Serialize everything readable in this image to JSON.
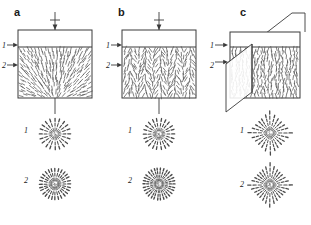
{
  "figure": {
    "background_color": "#ffffff",
    "line_color": "#3a3a3a",
    "director_color": "#555555"
  },
  "panels": [
    {
      "letter": "a",
      "layer_labels": [
        "1",
        "2"
      ],
      "top_symbol": "downward-arrow",
      "bottom_symbol": "vertical-line",
      "cell": {
        "isotropic_layer_label": "1",
        "nematic_layer_label": "2",
        "director_pattern": "radial-splay-from-bottom-center"
      },
      "patterns": [
        {
          "label": "1",
          "type": "radial-star",
          "rays": 20,
          "dashes_per_ray": 3,
          "shape": "circular"
        },
        {
          "label": "2",
          "type": "radial-star",
          "rays": 28,
          "dashes_per_ray": 3,
          "shape": "circular"
        }
      ]
    },
    {
      "letter": "b",
      "layer_labels": [
        "1",
        "2"
      ],
      "top_symbol": "downward-arrow",
      "bottom_symbol": "vertical-line",
      "cell": {
        "isotropic_layer_label": "1",
        "nematic_layer_label": "2",
        "director_pattern": "vertical-wavy-columns"
      },
      "patterns": [
        {
          "label": "1",
          "type": "radial-star",
          "rays": 22,
          "dashes_per_ray": 3,
          "shape": "circular"
        },
        {
          "label": "2",
          "type": "radial-star",
          "rays": 30,
          "dashes_per_ray": 4,
          "shape": "circular"
        }
      ]
    },
    {
      "letter": "c",
      "layer_labels": [
        "1",
        "2"
      ],
      "top_symbol": "bent-connector",
      "bottom_symbol": "none",
      "cell": {
        "isotropic_layer_label": "1",
        "nematic_layer_label": "2",
        "director_pattern": "vertical-with-inserted-plate",
        "has_inserted_plate": true,
        "perspective": "3d-oblique"
      },
      "patterns": [
        {
          "label": "1",
          "type": "four-lobed-diamond",
          "rays": 24,
          "dashes_per_ray": 4,
          "shape": "diamond"
        },
        {
          "label": "2",
          "type": "four-lobed-diamond",
          "rays": 28,
          "dashes_per_ray": 4,
          "shape": "diamond"
        }
      ]
    }
  ]
}
